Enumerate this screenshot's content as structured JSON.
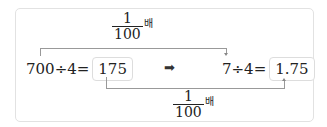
{
  "top_multiplier": {
    "numerator": "1",
    "denominator": "100",
    "suffix": "배"
  },
  "bottom_multiplier": {
    "numerator": "1",
    "denominator": "100",
    "suffix": "배"
  },
  "left_equation": {
    "expression": "700÷4=",
    "answer": "175"
  },
  "right_equation": {
    "expression": "7÷4=",
    "answer": "1.75"
  },
  "arrow_symbol": "➡"
}
